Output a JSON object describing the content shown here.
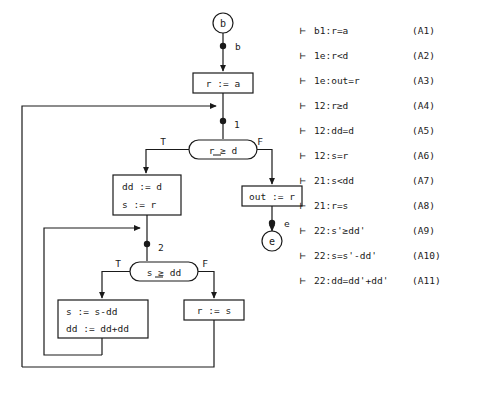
{
  "diagram": {
    "nodes": {
      "start_circle": "b",
      "start_edge_label": "b",
      "assign_r_a": "r  :=  a",
      "point_1_label": "1",
      "decision_r_ge_d": "r  ≥  d",
      "branch_true_1": "T",
      "branch_false_1": "F",
      "assign_dd_d": "dd  :=  d",
      "assign_s_r": "s   :=  r",
      "assign_out_r": "out  :=  r",
      "end_edge_label": "e",
      "end_circle": "e",
      "point_2_label": "2",
      "decision_s_ge_dd": "s  ≥  dd",
      "branch_true_2": "T",
      "branch_false_2": "F",
      "assign_s_sub": "s   :=  s-dd",
      "assign_dd_add": "dd  :=  dd+dd",
      "assign_r_s": "r  :=  s"
    }
  },
  "axioms": {
    "turnstile": "⊢",
    "items": [
      {
        "formula": "b1:r=a",
        "label": "(A1)"
      },
      {
        "formula": "1e:r<d",
        "label": "(A2)"
      },
      {
        "formula": "1e:out=r",
        "label": "(A3)"
      },
      {
        "formula": "12:r≥d",
        "label": "(A4)"
      },
      {
        "formula": "12:dd=d",
        "label": "(A5)"
      },
      {
        "formula": "12:s=r",
        "label": "(A6)"
      },
      {
        "formula": "21:s<dd",
        "label": "(A7)"
      },
      {
        "formula": "21:r=s",
        "label": "(A8)"
      },
      {
        "formula": "22:s'≥dd'",
        "label": "(A9)"
      },
      {
        "formula": "22:s=s'-dd'",
        "label": "(A10)"
      },
      {
        "formula": "22:dd=dd'+dd'",
        "label": "(A11)"
      }
    ]
  },
  "colors": {
    "ink": "#1a1a1a",
    "background": "#ffffff"
  }
}
